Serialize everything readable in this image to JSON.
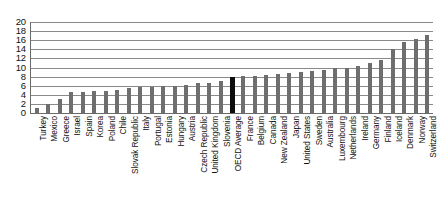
{
  "chart_data": {
    "type": "bar",
    "title": "",
    "subtitle": "",
    "xlabel": "",
    "ylabel": "",
    "ylim": [
      0,
      20
    ],
    "ytick_step": 2,
    "yticks": [
      20,
      18,
      16,
      14,
      12,
      10,
      8,
      6,
      4,
      2,
      0
    ],
    "grid": true,
    "legend": "none",
    "highlight_category": "OECD Average",
    "highlight_color": "#0d0d0d",
    "bar_color": "#6e6e6e",
    "categories": [
      "Turkey",
      "Mexico",
      "Greece",
      "Israel",
      "Spain",
      "Korea",
      "Poland",
      "Chile",
      "Slovak Republic",
      "Italy",
      "Portugal",
      "Estonia",
      "Hungary",
      "Austria",
      "Czech Republic",
      "United Kingdom",
      "Slovenia",
      "OECD Average",
      "France",
      "Belgium",
      "Canada",
      "New Zealand",
      "Japan",
      "United States",
      "Sweden",
      "Australia",
      "Luxembourg",
      "Netherlands",
      "Ireland",
      "Germany",
      "Finland",
      "Iceland",
      "Denmark",
      "Norway",
      "Switzerland"
    ],
    "values": [
      1.0,
      2.0,
      3.0,
      4.6,
      4.6,
      4.8,
      4.9,
      5.0,
      5.6,
      5.7,
      5.8,
      5.9,
      6.0,
      6.1,
      6.5,
      6.6,
      7.0,
      8.0,
      8.1,
      8.2,
      8.4,
      8.6,
      8.8,
      9.0,
      9.3,
      9.5,
      9.8,
      10.0,
      10.3,
      11.0,
      11.6,
      14.0,
      15.5,
      16.2,
      17.2
    ]
  }
}
